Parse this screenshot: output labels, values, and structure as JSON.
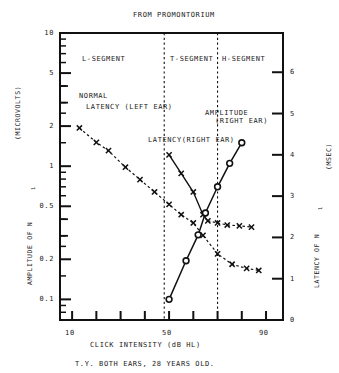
{
  "figure": {
    "title": "FROM PROMONTORIUM",
    "caption": "T.Y. BOTH EARS, 28 YEARS OLD.",
    "xlabel": "CLICK INTENSITY (dB HL)",
    "ylabel_left_1": "AMPLITUDE OF N",
    "ylabel_left_sub": "1",
    "ylabel_left_2": "(MICROVOLTS)",
    "ylabel_right_1": "LATENCY OF N",
    "ylabel_right_sub": "1",
    "ylabel_right_2": "(MSEC)"
  },
  "segments": [
    {
      "label": "L-SEGMENT",
      "x": 82,
      "y": 55
    },
    {
      "label": "T-SEGMENT",
      "x": 170,
      "y": 55
    },
    {
      "label": "H-SEGMENT",
      "x": 222,
      "y": 55
    }
  ],
  "annotations": [
    {
      "name": "normal-latency-label-line1",
      "text": "NORMAL",
      "x": 79,
      "y": 92
    },
    {
      "name": "normal-latency-label-line2",
      "text": "LATENCY (LEFT EAR)",
      "x": 86,
      "y": 103
    },
    {
      "name": "amplitude-label-line1",
      "text": "AMPLITUDE",
      "x": 205,
      "y": 109
    },
    {
      "name": "amplitude-label-line2",
      "text": "(RIGHT EAR)",
      "x": 215,
      "y": 117
    },
    {
      "name": "latency-right-ear-label",
      "text": "LATENCY(RIGHT EAR)",
      "x": 148,
      "y": 136
    }
  ],
  "chart_data": {
    "type": "line",
    "title": "FROM PROMONTORIUM",
    "subtitle": "T.Y. BOTH EARS, 28 YEARS OLD.",
    "xlabel": "CLICK INTENSITY (dB HL)",
    "ylabel": "AMPLITUDE OF N1 (MICROVOLTS)",
    "ylabel_secondary": "LATENCY OF N1 (MSEC)",
    "xlim": [
      5,
      97
    ],
    "xscale": "linear",
    "xticks": [
      10,
      20,
      30,
      40,
      50,
      60,
      70,
      80,
      90
    ],
    "xtick_labels": [
      "10",
      "",
      "",
      "",
      "50",
      "",
      "",
      "",
      "90"
    ],
    "ylim_left": [
      0.07,
      10
    ],
    "yscale_left": "log",
    "yticks_left": [
      0.1,
      0.2,
      0.3,
      0.4,
      0.5,
      1,
      2,
      3,
      4,
      5,
      10
    ],
    "ytick_labels_left": [
      "0.1",
      "0.2",
      "",
      "",
      "0.5",
      "1",
      "2",
      "",
      "",
      "5",
      "10"
    ],
    "ylim_right": [
      0,
      6.95
    ],
    "yscale_right": "linear",
    "yticks_right": [
      0,
      1,
      2,
      3,
      4,
      5,
      6
    ],
    "ytick_labels_right": [
      "0",
      "1",
      "2",
      "3",
      "4",
      "5",
      "6"
    ],
    "grid": false,
    "vertical_dividers": [
      {
        "label": "L/T boundary",
        "x": 48
      },
      {
        "label": "T/H boundary",
        "x": 70
      }
    ],
    "series": [
      {
        "name": "NORMAL LATENCY (LEFT EAR)",
        "axis": "right",
        "unit": "msec",
        "marker": "x",
        "linestyle": "dashed",
        "points": [
          {
            "x": 13,
            "y": 4.65
          },
          {
            "x": 20,
            "y": 4.3
          },
          {
            "x": 25,
            "y": 4.1
          },
          {
            "x": 32,
            "y": 3.7
          },
          {
            "x": 38,
            "y": 3.4
          },
          {
            "x": 44,
            "y": 3.1
          },
          {
            "x": 50,
            "y": 2.8
          },
          {
            "x": 55,
            "y": 2.55
          },
          {
            "x": 60,
            "y": 2.35
          },
          {
            "x": 64,
            "y": 2.05
          },
          {
            "x": 70,
            "y": 1.6
          },
          {
            "x": 76,
            "y": 1.35
          },
          {
            "x": 82,
            "y": 1.25
          },
          {
            "x": 87,
            "y": 1.2
          }
        ]
      },
      {
        "name": "LATENCY(RIGHT EAR)",
        "axis": "right",
        "unit": "msec",
        "marker": "x",
        "linestyle": "solid-then-dashed",
        "points": [
          {
            "x": 50,
            "y": 4.0
          },
          {
            "x": 55,
            "y": 3.55
          },
          {
            "x": 60,
            "y": 3.1
          },
          {
            "x": 64,
            "y": 2.55
          },
          {
            "x": 66,
            "y": 2.4
          },
          {
            "x": 70,
            "y": 2.35
          },
          {
            "x": 74,
            "y": 2.3
          },
          {
            "x": 79,
            "y": 2.28
          },
          {
            "x": 84,
            "y": 2.25
          }
        ]
      },
      {
        "name": "AMPLITUDE (RIGHT EAR)",
        "axis": "left",
        "unit": "microvolts",
        "marker": "o",
        "linestyle": "solid",
        "points": [
          {
            "x": 50,
            "y": 0.1
          },
          {
            "x": 57,
            "y": 0.195
          },
          {
            "x": 62,
            "y": 0.305
          },
          {
            "x": 65,
            "y": 0.445
          },
          {
            "x": 70,
            "y": 0.7
          },
          {
            "x": 75,
            "y": 1.05
          },
          {
            "x": 80,
            "y": 1.5
          }
        ]
      }
    ]
  }
}
